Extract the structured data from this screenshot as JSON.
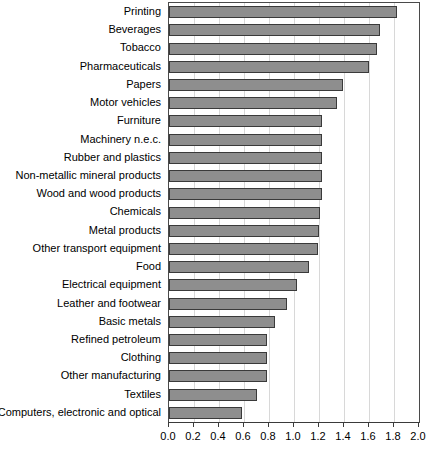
{
  "chart_data": {
    "type": "bar",
    "orientation": "horizontal",
    "title": "",
    "subtitle": "",
    "xlabel": "",
    "ylabel": "",
    "xlim": [
      0.0,
      2.0
    ],
    "xticks": [
      "0.0",
      "0.2",
      "0.4",
      "0.6",
      "0.8",
      "1.0",
      "1.2",
      "1.4",
      "1.6",
      "1.8",
      "2.0"
    ],
    "xtick_values": [
      0.0,
      0.2,
      0.4,
      0.6,
      0.8,
      1.0,
      1.2,
      1.4,
      1.6,
      1.8,
      2.0
    ],
    "grid": "vertical",
    "legend": "none",
    "bar_color": "#8e8e8e",
    "bar_edge_color": "#3a3a3a",
    "categories": [
      "Printing",
      "Beverages",
      "Tobacco",
      "Pharmaceuticals",
      "Papers",
      "Motor vehicles",
      "Furniture",
      "Machinery n.e.c.",
      "Rubber and plastics",
      "Non-metallic mineral products",
      "Wood and wood products",
      "Chemicals",
      "Metal products",
      "Other transport equipment",
      "Food",
      "Electrical equipment",
      "Leather and footwear",
      "Basic metals",
      "Refined petroleum",
      "Clothing",
      "Other manufacturing",
      "Textiles",
      "Computers, electronic and optical"
    ],
    "values": [
      1.82,
      1.69,
      1.66,
      1.6,
      1.39,
      1.34,
      1.22,
      1.22,
      1.22,
      1.22,
      1.22,
      1.21,
      1.2,
      1.19,
      1.12,
      1.02,
      0.94,
      0.85,
      0.78,
      0.78,
      0.78,
      0.7,
      0.58
    ]
  }
}
